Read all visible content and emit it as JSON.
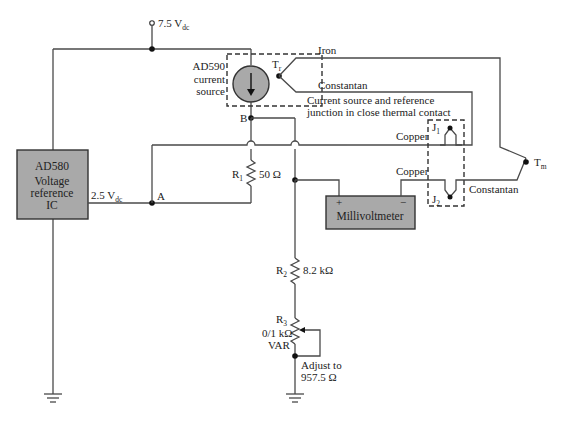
{
  "diagram": {
    "supply": {
      "label": "7.5 V",
      "subscript": "dc"
    },
    "reference_ic": {
      "lines": [
        "AD580",
        "Voltage",
        "reference",
        "IC"
      ],
      "output_label": "2.5 V",
      "output_subscript": "dc"
    },
    "current_source": {
      "lines": [
        "AD590",
        "current",
        "source"
      ]
    },
    "nodes": {
      "a": "A",
      "b": "B"
    },
    "resistors": {
      "r1": {
        "name": "R",
        "sub": "1",
        "value": "50 Ω"
      },
      "r2": {
        "name": "R",
        "sub": "2",
        "value": "8.2 kΩ"
      },
      "r3": {
        "name": "R",
        "sub": "3",
        "value": "0/1 kΩ",
        "note": "VAR"
      }
    },
    "adjust_note": [
      "Adjust to",
      "957.5 Ω"
    ],
    "thermal_note": [
      "Current source and reference",
      "junction in close thermal contact"
    ],
    "junctions": {
      "tr": {
        "name": "T",
        "sub": "r"
      },
      "tm": {
        "name": "T",
        "sub": "m"
      },
      "j1": {
        "name": "J",
        "sub": "1"
      },
      "j2": {
        "name": "J",
        "sub": "2"
      }
    },
    "wires": {
      "iron": "Iron",
      "constantan_top": "Constantan",
      "constantan_bottom": "Constantan",
      "copper_top": "Copper",
      "copper_bottom": "Copper"
    },
    "meter": {
      "label": "Millivoltmeter",
      "plus": "+",
      "minus": "−"
    }
  }
}
